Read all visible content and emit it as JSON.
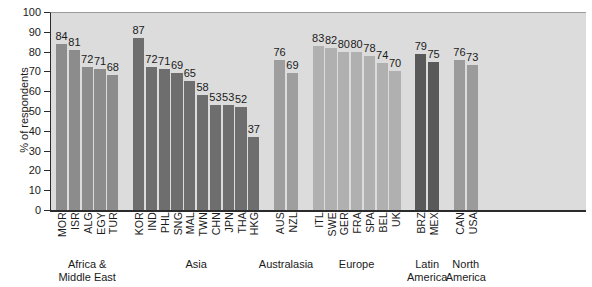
{
  "chart_data": {
    "type": "bar",
    "title": "",
    "xlabel": "",
    "ylabel": "% of respondents",
    "ylim": [
      0,
      100
    ],
    "ytick_step": 10,
    "yticks": [
      100,
      90,
      80,
      70,
      60,
      50,
      40,
      30,
      20,
      10,
      0
    ],
    "grid": false,
    "legend": "none",
    "categories": [
      "MOR",
      "ISR",
      "ALG",
      "EGY",
      "TUR",
      "KOR",
      "IND",
      "PHL",
      "SNG",
      "MAL",
      "TWN",
      "CHN",
      "JPN",
      "THA",
      "HKG",
      "AUS",
      "NZL",
      "ITL",
      "SWE",
      "GER",
      "FRA",
      "SPA",
      "BEL",
      "UK",
      "BRZ",
      "MEX",
      "CAN",
      "USA"
    ],
    "values": [
      84,
      81,
      72,
      71,
      68,
      87,
      72,
      71,
      69,
      65,
      58,
      53,
      53,
      52,
      37,
      76,
      69,
      83,
      82,
      80,
      80,
      78,
      74,
      70,
      79,
      75,
      76,
      73
    ],
    "groups": [
      {
        "name": "Africa &\nMiddle East",
        "name_lines": [
          "Africa &",
          "Middle East"
        ],
        "color": "#8c8c8c",
        "bars": [
          {
            "label": "MOR",
            "value": 84
          },
          {
            "label": "ISR",
            "value": 81
          },
          {
            "label": "ALG",
            "value": 72
          },
          {
            "label": "EGY",
            "value": 71
          },
          {
            "label": "TUR",
            "value": 68
          }
        ]
      },
      {
        "name": "Asia",
        "name_lines": [
          "Asia"
        ],
        "color": "#6e6e6e",
        "bars": [
          {
            "label": "KOR",
            "value": 87
          },
          {
            "label": "IND",
            "value": 72
          },
          {
            "label": "PHL",
            "value": 71
          },
          {
            "label": "SNG",
            "value": 69
          },
          {
            "label": "MAL",
            "value": 65
          },
          {
            "label": "TWN",
            "value": 58
          },
          {
            "label": "CHN",
            "value": 53
          },
          {
            "label": "JPN",
            "value": 53
          },
          {
            "label": "THA",
            "value": 52
          },
          {
            "label": "HKG",
            "value": 37
          }
        ]
      },
      {
        "name": "Australasia",
        "name_lines": [
          "Australasia"
        ],
        "color": "#9e9e9e",
        "bars": [
          {
            "label": "AUS",
            "value": 76
          },
          {
            "label": "NZL",
            "value": 69
          }
        ]
      },
      {
        "name": "Europe",
        "name_lines": [
          "Europe"
        ],
        "color": "#b0b0b0",
        "bars": [
          {
            "label": "ITL",
            "value": 83
          },
          {
            "label": "SWE",
            "value": 82
          },
          {
            "label": "GER",
            "value": 80
          },
          {
            "label": "FRA",
            "value": 80
          },
          {
            "label": "SPA",
            "value": 78
          },
          {
            "label": "BEL",
            "value": 74
          },
          {
            "label": "UK",
            "value": 70
          }
        ]
      },
      {
        "name": "Latin\nAmerica",
        "name_lines": [
          "Latin",
          "America"
        ],
        "color": "#595959",
        "bars": [
          {
            "label": "BRZ",
            "value": 79
          },
          {
            "label": "MEX",
            "value": 75
          }
        ]
      },
      {
        "name": "North\nAmerica",
        "name_lines": [
          "North",
          "America"
        ],
        "color": "#9b9b9b",
        "bars": [
          {
            "label": "CAN",
            "value": 76
          },
          {
            "label": "USA",
            "value": 73
          }
        ]
      }
    ]
  },
  "colors": {
    "plot_background": "#dcdcdc",
    "axis": "#2b2b2b",
    "text": "#1a1a1a"
  }
}
